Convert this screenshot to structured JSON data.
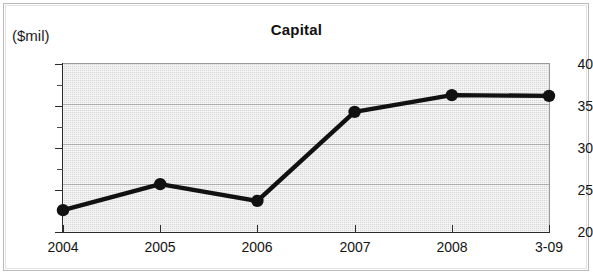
{
  "figure": {
    "unit_label": "($mil)",
    "title": "Capital"
  },
  "chart_data": {
    "type": "line",
    "title": "Capital",
    "subtitle": "",
    "xlabel": "",
    "ylabel": "($mil)",
    "ylabel_note": "Values in millions of dollars",
    "categories": [
      "2004",
      "2005",
      "2006",
      "2007",
      "2008",
      "3-09"
    ],
    "x": [
      "2004",
      "2005",
      "2006",
      "2007",
      "2008",
      "3-09"
    ],
    "values": [
      22.6,
      25.7,
      23.7,
      34.3,
      36.3,
      36.2
    ],
    "series": [
      {
        "name": "Capital",
        "values": [
          22.6,
          25.7,
          23.7,
          34.3,
          36.3,
          36.2
        ]
      }
    ],
    "ylim": [
      20,
      40
    ],
    "ytick_labels": [
      "20",
      "25",
      "30",
      "35",
      "40"
    ],
    "ytick_values": [
      20,
      25,
      30,
      35,
      40
    ],
    "yminor_tick_values": [
      22.5,
      27.5,
      32.5,
      37.5
    ],
    "xtick_labels": [
      "2004",
      "2005",
      "2006",
      "2007",
      "2008",
      "3-09"
    ],
    "grid": true,
    "grid_axis": "y",
    "legend": false,
    "legend_position": "none",
    "marker": "filled-circle",
    "line_color": "#111111",
    "marker_color": "#111111",
    "plot_background_color": "#d8d8d8",
    "figure_background_color": "#ffffff"
  }
}
